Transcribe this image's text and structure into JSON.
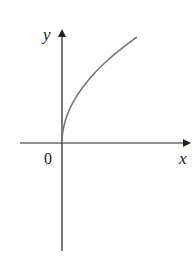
{
  "chart_data": {
    "type": "line",
    "title": "",
    "xlabel": "x",
    "ylabel": "y",
    "origin_label": "0",
    "function": "y = sqrt(x)",
    "series": [
      {
        "name": "y = sqrt(x)",
        "x": [
          0,
          0.25,
          1,
          2.25,
          4,
          6.25,
          9
        ],
        "y": [
          0,
          0.5,
          1,
          1.5,
          2,
          2.5,
          3
        ]
      }
    ],
    "grid": false,
    "legend": null,
    "colors": {
      "axis": "#222222",
      "curve": "#777777"
    }
  },
  "labels": {
    "x_axis": "x",
    "y_axis": "y",
    "origin": "0"
  }
}
